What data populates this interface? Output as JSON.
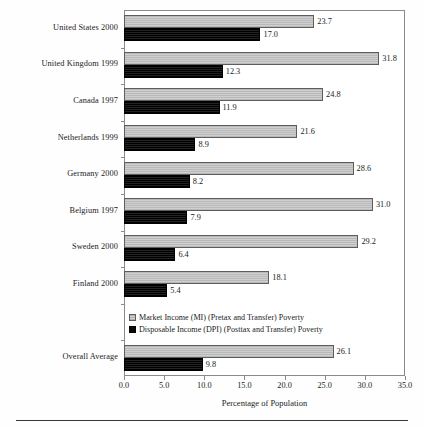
{
  "chart_data": {
    "type": "bar",
    "orientation": "horizontal",
    "title": "",
    "xlabel": "Percentage of Population",
    "ylabel": "",
    "xlim": [
      0.0,
      35.0
    ],
    "xticks": [
      "0.0",
      "5.0",
      "10.0",
      "15.0",
      "20.0",
      "25.0",
      "30.0",
      "35.0"
    ],
    "xtick_values": [
      0,
      5,
      10,
      15,
      20,
      25,
      30,
      35
    ],
    "grid": false,
    "legend_position": "inside-lower-left",
    "categories": [
      "United States 2000",
      "United Kingdom 1999",
      "Canada 1997",
      "Netherlands 1999",
      "Germany 2000",
      "Belgium 1997",
      "Sweden 2000",
      "Finland 2000",
      "Overall Average"
    ],
    "series": [
      {
        "name": "Market Income (MI) (Pretax and Transfer) Poverty",
        "key": "mi",
        "color": "#c3c3c3",
        "values": [
          23.7,
          31.8,
          24.8,
          21.6,
          28.6,
          31.0,
          29.2,
          18.1,
          26.1
        ],
        "labels": [
          "23.7",
          "31.8",
          "24.8",
          "21.6",
          "28.6",
          "31.0",
          "29.2",
          "18.1",
          "26.1"
        ]
      },
      {
        "name": "Disposable Income (DPI) (Posttax and Transfer) Poverty",
        "key": "dpi",
        "color": "#0a0a0a",
        "values": [
          17.0,
          12.3,
          11.9,
          8.9,
          8.2,
          7.9,
          6.4,
          5.4,
          9.8
        ],
        "labels": [
          "17.0",
          "12.3",
          "11.9",
          "8.9",
          "8.2",
          "7.9",
          "6.4",
          "5.4",
          "9.8"
        ]
      }
    ]
  },
  "legend": {
    "items": [
      {
        "label": "Market Income (MI) (Pretax and Transfer) Poverty",
        "swatch": "mi"
      },
      {
        "label": "Disposable Income (DPI) (Posttax and Transfer) Poverty",
        "swatch": "dpi"
      }
    ]
  },
  "axis": {
    "x_title": "Percentage of Population",
    "ticks": [
      "0.0",
      "5.0",
      "10.0",
      "15.0",
      "20.0",
      "25.0",
      "30.0",
      "35.0"
    ]
  }
}
